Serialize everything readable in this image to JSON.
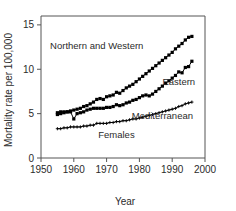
{
  "chart_data": {
    "type": "line",
    "title": "",
    "xlabel": "Year",
    "ylabel": "Mortality rate per 100,000",
    "xlim": [
      1950,
      2000
    ],
    "ylim": [
      0,
      16
    ],
    "xticks": [
      1950,
      1960,
      1970,
      1980,
      1990,
      2000
    ],
    "yticks": [
      0,
      5,
      10,
      15
    ],
    "grid": false,
    "legend_position": "inline-annotations",
    "annotations": [
      {
        "text": "Northern and Western",
        "x": 1967,
        "y": 12.3
      },
      {
        "text": "Eastern",
        "x": 1992,
        "y": 8.2
      },
      {
        "text": "Mediterranean",
        "x": 1987,
        "y": 4.4
      },
      {
        "text": "Females",
        "x": 1973,
        "y": 2.2
      }
    ],
    "x": [
      1955,
      1956,
      1957,
      1958,
      1959,
      1960,
      1961,
      1962,
      1963,
      1964,
      1965,
      1966,
      1967,
      1968,
      1969,
      1970,
      1971,
      1972,
      1973,
      1974,
      1975,
      1976,
      1977,
      1978,
      1979,
      1980,
      1981,
      1982,
      1983,
      1984,
      1985,
      1986,
      1987,
      1988,
      1989,
      1990,
      1991,
      1992,
      1993,
      1994,
      1995,
      1996
    ],
    "series": [
      {
        "name": "Northern and Western",
        "marker": "square",
        "values": [
          4.9,
          5.0,
          5.1,
          5.2,
          5.3,
          5.4,
          5.5,
          5.6,
          5.8,
          5.9,
          6.1,
          6.3,
          6.6,
          6.7,
          6.6,
          6.9,
          7.0,
          7.1,
          7.4,
          7.3,
          7.6,
          7.9,
          8.1,
          8.3,
          8.6,
          8.9,
          9.2,
          9.5,
          9.8,
          10.1,
          10.4,
          10.7,
          11.0,
          11.3,
          11.6,
          11.9,
          12.3,
          12.6,
          12.9,
          13.3,
          13.6,
          13.7
        ]
      },
      {
        "name": "Eastern",
        "marker": "square",
        "values": [
          5.1,
          5.2,
          5.2,
          5.2,
          5.2,
          4.4,
          5.0,
          5.1,
          5.2,
          5.4,
          5.5,
          5.6,
          5.6,
          5.6,
          5.6,
          5.7,
          5.7,
          5.8,
          6.0,
          5.9,
          6.0,
          6.2,
          6.3,
          6.5,
          6.6,
          6.8,
          7.0,
          7.1,
          7.0,
          7.2,
          7.5,
          7.8,
          8.1,
          8.4,
          8.7,
          9.0,
          9.3,
          9.7,
          9.6,
          10.2,
          10.3,
          10.9
        ]
      },
      {
        "name": "Mediterranean",
        "marker": "plus",
        "values": [
          3.3,
          3.3,
          3.4,
          3.4,
          3.5,
          3.5,
          3.5,
          3.5,
          3.6,
          3.6,
          3.7,
          3.7,
          3.9,
          3.9,
          3.9,
          3.9,
          4.0,
          4.0,
          4.1,
          4.1,
          4.2,
          4.2,
          4.3,
          4.4,
          4.4,
          4.5,
          4.6,
          4.7,
          4.8,
          4.9,
          5.0,
          5.1,
          5.2,
          5.3,
          5.4,
          5.5,
          5.6,
          5.8,
          5.9,
          6.1,
          6.2,
          6.3
        ]
      }
    ]
  }
}
